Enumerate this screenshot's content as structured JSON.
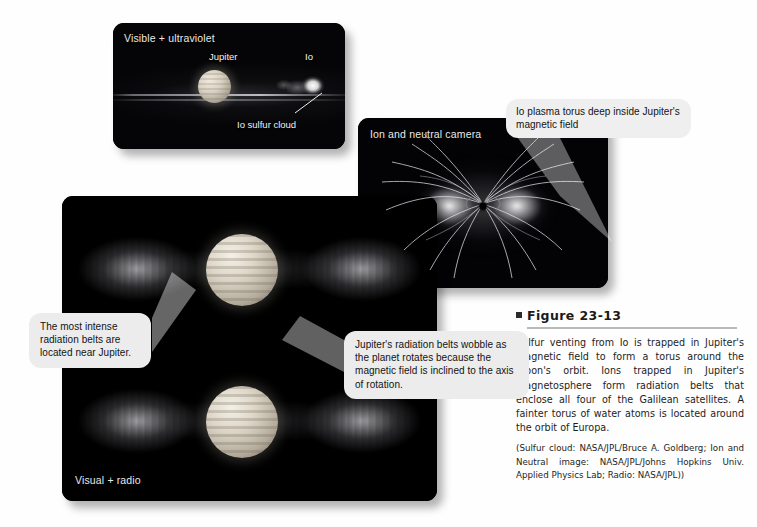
{
  "figure": {
    "bullet_icon": "square-bullet-icon",
    "number_label": "Figure 23-13",
    "caption_body": "Sulfur venting from Io is trapped in Jupiter's magnetic field to form a torus around the moon's orbit. Ions trapped in Jupiter's magnetosphere form radiation belts that enclose all four of the Galilean satellites. A fainter torus of water atoms is located around the orbit of Europa.",
    "caption_credits": "(Sulfur cloud: NASA/JPL/Bruce A. Goldberg; Ion and Neutral image: NASA/JPL/Johns Hopkins Univ. Applied Physics Lab; Radio: NASA/JPL))"
  },
  "panels": {
    "visible_uv": {
      "label": "Visible + ultraviolet",
      "labels": {
        "jupiter": "Jupiter",
        "io": "Io",
        "sulfur_cloud": "Io sulfur cloud"
      }
    },
    "ion_neutral": {
      "label": "Ion and neutral camera"
    },
    "visual_radio": {
      "label": "Visual + radio"
    }
  },
  "callouts": {
    "torus": "Io plasma torus deep inside Jupiter's magnetic field",
    "intense_belts": "The most intense radiation belts are located near Jupiter.",
    "wobble": "Jupiter's radiation belts wobble as the planet rotates because the magnetic field is inclined to the axis of rotation."
  },
  "colors": {
    "page_background": "#fefefe",
    "panel_background": "#050505",
    "callout_background": "#ececec",
    "caption_text": "#1d1d1d",
    "rule": "#b9b9b9"
  }
}
